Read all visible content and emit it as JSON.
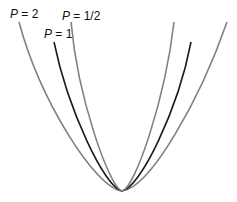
{
  "diagram": {
    "title": "",
    "curves": [
      {
        "label_var": "P",
        "label_rest": " = 2",
        "color": "#808080"
      },
      {
        "label_var": "P",
        "label_rest": " = 1",
        "color": "#1a1a1a"
      },
      {
        "label_var": "P",
        "label_rest": " = 1/2",
        "color": "#808080"
      }
    ]
  }
}
